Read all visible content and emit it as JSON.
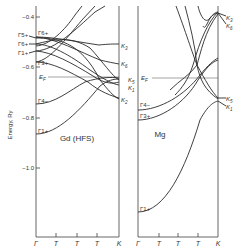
{
  "figure": {
    "type": "band-structure-diagram",
    "y_axis": {
      "label": "Energy, Ry",
      "ticks": [
        "-0.4",
        "-0.6",
        "-0.8",
        "-1.0"
      ]
    },
    "panels": [
      {
        "name": "Gd (HFS)",
        "x_ticks": [
          "Γ",
          "T",
          "T",
          "T",
          "K"
        ],
        "fermi_label": "E_F",
        "gamma_labels": [
          "Γ6+",
          "Γ5+",
          "Γ5+",
          "Γ6+",
          "Γ1+",
          "Γ3+",
          "Γ4−",
          "Γ1+"
        ],
        "k_labels": [
          "K3",
          "K6",
          "K5",
          "K1",
          "K2"
        ]
      },
      {
        "name": "Mg",
        "x_ticks": [
          "Γ",
          "T",
          "T",
          "T",
          "K"
        ],
        "fermi_label": "E_F",
        "gamma_labels": [
          "Γ4−",
          "Γ3+",
          "Γ1+"
        ],
        "k_labels": [
          "K3",
          "K6",
          "K5",
          "K1"
        ]
      }
    ]
  },
  "labels": {
    "ylabel": "Energy, Ry",
    "y_m04": "−0.4",
    "y_m06": "−0.6",
    "y_m08": "−0.8",
    "y_m10": "−1.0",
    "gd_title": "Gd (HFS)",
    "mg_title": "Mg",
    "ef": "E",
    "ef_sub": "F",
    "gamma": "Γ",
    "t": "T",
    "k": "K",
    "g6p": "Γ6+",
    "g5p": "Γ5+",
    "g1p": "Γ1+",
    "g3p": "Γ3+",
    "g4m": "Γ4−",
    "k3": "K",
    "k3s": "3",
    "k6": "K",
    "k6s": "6",
    "k5": "K",
    "k5s": "5",
    "k1": "K",
    "k1s": "1",
    "k2": "K",
    "k2s": "2"
  }
}
